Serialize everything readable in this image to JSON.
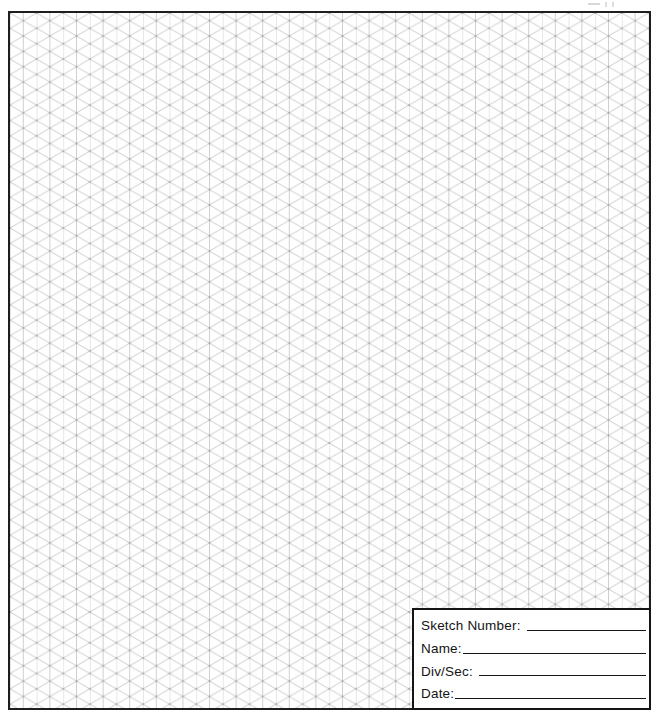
{
  "page": {
    "background": "#ffffff",
    "frame_border_color": "#1e1e1e"
  },
  "grid": {
    "type": "isometric-triangular",
    "line_color": "#8c8c8c",
    "node_color": "#8f8f8f",
    "column_spacing_px": 13.3,
    "row_spacing_px": 15.36
  },
  "title_block": {
    "fields": [
      {
        "label": "Sketch Number:",
        "value": ""
      },
      {
        "label": "Name:",
        "value": ""
      },
      {
        "label": "Div/Sec:",
        "value": ""
      },
      {
        "label": "Date:",
        "value": ""
      }
    ]
  }
}
